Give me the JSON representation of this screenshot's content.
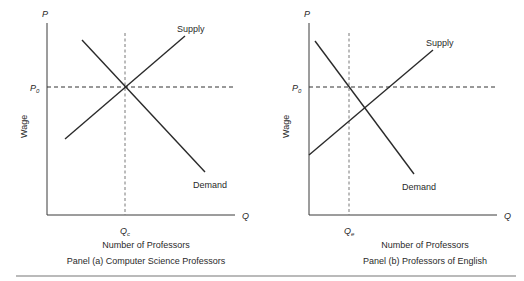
{
  "panels": [
    {
      "id": "a",
      "y_axis_letter": "P",
      "x_axis_letter": "Q",
      "y_axis_title": "Wage",
      "price_label_main": "P",
      "price_label_sub": "0",
      "qty_label_main": "Q",
      "qty_label_sub": "c",
      "supply_label": "Supply",
      "demand_label": "Demand",
      "x_axis_title": "Number of Professors",
      "caption": "Panel (a) Computer Science Professors"
    },
    {
      "id": "b",
      "y_axis_letter": "P",
      "x_axis_letter": "Q",
      "y_axis_title": "Wage",
      "price_label_main": "P",
      "price_label_sub": "0",
      "qty_label_main": "Q",
      "qty_label_sub": "e",
      "supply_label": "Supply",
      "demand_label": "Demand",
      "x_axis_title": "Number of Professors",
      "caption": "Panel (b) Professors of English"
    }
  ],
  "colors": {
    "line": "#2a2a2a",
    "background": "#ffffff",
    "divider": "#777777"
  }
}
